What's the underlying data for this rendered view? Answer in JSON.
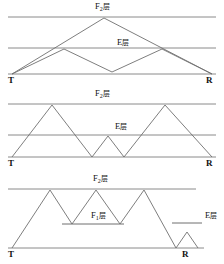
{
  "figure": {
    "title": "",
    "width": 224,
    "height": 264,
    "colors": {
      "layer_line": "#8a8a8a",
      "ground_line": "#8a8a8a",
      "ray_path": "#6f6f6f",
      "text": "#111111",
      "background": "#ffffff"
    }
  },
  "labels": {
    "f2_layer": "F",
    "f2_sub": "2",
    "f2_suffix": "层",
    "f1_layer": "F",
    "f1_sub": "1",
    "f1_suffix": "层",
    "e_layer": "E",
    "e_suffix": "层",
    "transmitter": "T",
    "receiver": "R"
  },
  "panels": [
    {
      "id": "panel-1-single-hop",
      "name": "F2 single hop with E layer double hop",
      "layer_lines": [
        {
          "name": "f2-layer-line",
          "label": "F2层",
          "y": 17,
          "x1": 8,
          "x2": 216
        },
        {
          "name": "e-layer-line",
          "label": "E层",
          "y": 48,
          "x1": 8,
          "x2": 216
        },
        {
          "name": "ground-line",
          "label": "",
          "y": 74,
          "x1": 8,
          "x2": 216
        }
      ],
      "endpoints": {
        "transmitter_x": 12,
        "receiver_x": 212,
        "ground_y": 74
      },
      "ray_paths": [
        {
          "name": "f2-hop-path",
          "points": "12,74 104,18 212,74"
        },
        {
          "name": "e-hop-path",
          "points": "12,74 64,49 112,72 162,49 212,74"
        }
      ],
      "label_positions": [
        {
          "name": "f2-label",
          "text": "F2层",
          "x": 94,
          "y": 4
        },
        {
          "name": "e-label",
          "text": "E层",
          "x": 116,
          "y": 40
        }
      ]
    },
    {
      "id": "panel-2-double-hop",
      "name": "F2 double hop with intermediate E layer hop",
      "layer_lines": [
        {
          "name": "f2-layer-line",
          "label": "F2层",
          "y": 104,
          "x1": 8,
          "x2": 216
        },
        {
          "name": "e-layer-line",
          "label": "E层",
          "y": 135,
          "x1": 8,
          "x2": 216
        },
        {
          "name": "ground-line",
          "label": "",
          "y": 157,
          "x1": 8,
          "x2": 216
        }
      ],
      "endpoints": {
        "transmitter_x": 12,
        "receiver_x": 212,
        "ground_y": 157
      },
      "ray_paths": [
        {
          "name": "f2-double-hop-path",
          "points": "12,157 52,105 92,157 108,136 124,157 165,105 212,157"
        }
      ],
      "label_positions": [
        {
          "name": "f2-label",
          "text": "F2层",
          "x": 94,
          "y": 91
        },
        {
          "name": "e-label",
          "text": "E层",
          "x": 114,
          "y": 124
        }
      ]
    },
    {
      "id": "panel-3-multi-hop",
      "name": "F2 triple hop with F1 layer reflections and terminal E layer hop",
      "layer_lines": [
        {
          "name": "f2-layer-line",
          "label": "F2层",
          "y": 189,
          "x1": 8,
          "x2": 196
        },
        {
          "name": "f1-layer-line",
          "label": "F1层",
          "y": 224,
          "x1": 62,
          "x2": 124
        },
        {
          "name": "e-layer-line",
          "label": "E层",
          "y": 223,
          "x1": 172,
          "x2": 202
        },
        {
          "name": "ground-line",
          "label": "",
          "y": 248,
          "x1": 8,
          "x2": 204
        }
      ],
      "endpoints": {
        "transmitter_x": 12,
        "receiver_x": 188,
        "ground_y": 248
      },
      "ray_paths": [
        {
          "name": "f1-f2-multi-hop-path",
          "points": "12,248 50,190 72,224 96,190 120,224 144,190 176,248 187,232 198,248"
        }
      ],
      "label_positions": [
        {
          "name": "f2-label",
          "text": "F2层",
          "x": 92,
          "y": 176
        },
        {
          "name": "f1-label",
          "text": "F1层",
          "x": 90,
          "y": 213
        },
        {
          "name": "e-label",
          "text": "E层",
          "x": 203,
          "y": 213
        }
      ]
    }
  ],
  "endpoint_markers": [
    {
      "name": "transmitter-panel-1",
      "text": "T",
      "x": 8,
      "y": 76
    },
    {
      "name": "receiver-panel-1",
      "text": "R",
      "x": 206,
      "y": 76
    },
    {
      "name": "transmitter-panel-2",
      "text": "T",
      "x": 8,
      "y": 159
    },
    {
      "name": "receiver-panel-2",
      "text": "R",
      "x": 206,
      "y": 159
    },
    {
      "name": "transmitter-panel-3",
      "text": "T",
      "x": 8,
      "y": 250
    },
    {
      "name": "receiver-panel-3",
      "text": "R",
      "x": 182,
      "y": 250
    }
  ]
}
